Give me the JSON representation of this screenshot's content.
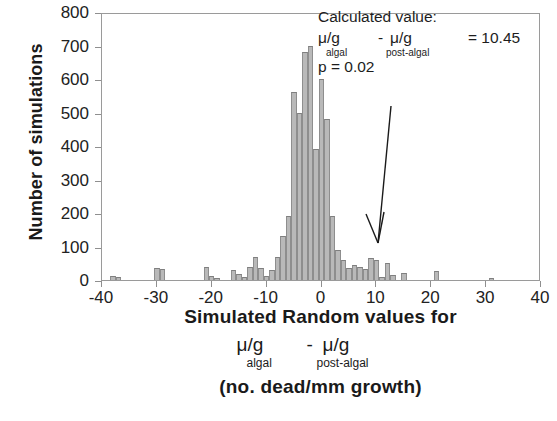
{
  "chart_data": {
    "type": "bar",
    "title": "",
    "xlabel": "Simulated Random values for μ/g algal - μ/g post-algal (no. dead/mm growth)",
    "ylabel": "Number of simulations",
    "xlim": [
      -40,
      40
    ],
    "ylim": [
      0,
      800
    ],
    "xticks": [
      -40,
      -30,
      -20,
      -10,
      0,
      10,
      20,
      30,
      40
    ],
    "yticks": [
      0,
      100,
      200,
      300,
      400,
      500,
      600,
      700,
      800
    ],
    "grid": false,
    "legend": null,
    "bin_width": 1,
    "bar_color": "#b9b9b9",
    "bar_edge_color": "#8e8e8e",
    "x": [
      -38,
      -37,
      -30,
      -29,
      -21,
      -20,
      -19,
      -16,
      -15,
      -14,
      -13,
      -12,
      -11,
      -10,
      -9,
      -8,
      -7,
      -6,
      -5,
      -4,
      -3,
      -2,
      -1,
      0,
      1,
      2,
      3,
      4,
      5,
      6,
      7,
      8,
      9,
      10,
      11,
      12,
      13,
      15,
      21,
      31
    ],
    "values": [
      12,
      8,
      36,
      34,
      40,
      12,
      6,
      30,
      18,
      8,
      38,
      70,
      36,
      12,
      30,
      68,
      130,
      190,
      560,
      500,
      680,
      700,
      390,
      600,
      480,
      190,
      90,
      60,
      35,
      45,
      40,
      32,
      65,
      60,
      8,
      50,
      16,
      22,
      28,
      6
    ],
    "annotations": {
      "calculated_value_label": "Calculated value:",
      "expression_mu1": "μ/g",
      "expression_sub1": "algal",
      "expression_minus": "-",
      "expression_mu2": "μ/g",
      "expression_sub2": "post-algal",
      "expression_equals": "= 10.45",
      "p_value": "p = 0.02",
      "arrow_points_to_x": 10.45
    }
  },
  "axes": {
    "y_title": "Number of simulations",
    "y_tick_labels": [
      "800",
      "700",
      "600",
      "500",
      "400",
      "300",
      "200",
      "100",
      "0"
    ],
    "x_tick_labels": [
      "-40",
      "-30",
      "-20",
      "-10",
      "0",
      "10",
      "20",
      "30",
      "40"
    ]
  },
  "annotation": {
    "line1": "Calculated value:",
    "mu1": "μ/g",
    "sub1": "algal",
    "minus": "-",
    "mu2": "μ/g",
    "sub2": "post-algal",
    "equals": "= 10.45",
    "p": "p = 0.02"
  },
  "x_title": {
    "line1": "Simulated Random values for",
    "mu1": "μ/g",
    "sub1": "algal",
    "minus": "-",
    "mu2": "μ/g",
    "sub2": "post-algal",
    "line3": "(no. dead/mm growth)"
  }
}
